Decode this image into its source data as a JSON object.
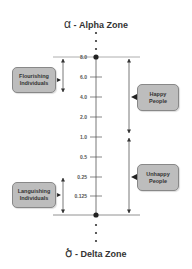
{
  "top_zone": {
    "symbol": "α",
    "label": " - Alpha Zone"
  },
  "bottom_zone": {
    "symbol": "ծ",
    "label": " - Delta Zone"
  },
  "axis": {
    "ticks": [
      {
        "label": "8.0",
        "y": 57
      },
      {
        "label": "6.0",
        "y": 77
      },
      {
        "label": "4.0",
        "y": 97
      },
      {
        "label": "2.0",
        "y": 117
      },
      {
        "label": "1.0",
        "y": 137
      },
      {
        "label": "0.5",
        "y": 157
      },
      {
        "label": "0.25",
        "y": 177
      },
      {
        "label": "0.125",
        "y": 196
      }
    ]
  },
  "boxes": {
    "flourishing": {
      "line1": "Flourishing",
      "line2": "Individuals"
    },
    "languishing": {
      "line1": "Languishing",
      "line2": "Individuals"
    },
    "happy": {
      "line1": "Happy",
      "line2": "People"
    },
    "unhappy": {
      "line1": "Unhappy",
      "line2": "People"
    }
  },
  "colors": {
    "box_fill": "#bdbdbd",
    "line": "#555555",
    "dot": "#222222"
  }
}
